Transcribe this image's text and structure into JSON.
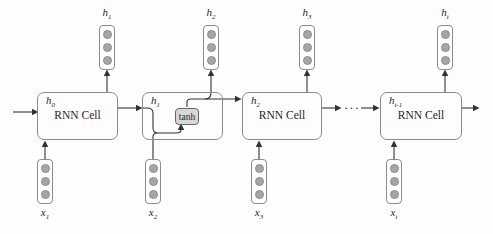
{
  "figure": {
    "type": "diagram",
    "ellipsis": "···",
    "colors": {
      "background": "#fdfdfd",
      "box_stroke": "#8c8c8c",
      "wire": "#333333",
      "neuron_fill": "#a6a6a6",
      "tanh_fill": "#d8d8d8",
      "tanh_stroke": "#666666",
      "text": "#1f1f1f"
    },
    "cells": [
      {
        "state_base": "h",
        "state_sub": "0",
        "body": "RNN Cell"
      },
      {
        "state_base": "h",
        "state_sub": "1",
        "body": "",
        "activation": "tanh"
      },
      {
        "state_base": "h",
        "state_sub": "2",
        "body": "RNN Cell"
      },
      {
        "state_base": "h",
        "state_sub": "t-1",
        "body": "RNN Cell"
      }
    ],
    "outputs": [
      {
        "base": "h",
        "sub": "1"
      },
      {
        "base": "h",
        "sub": "2"
      },
      {
        "base": "h",
        "sub": "3"
      },
      {
        "base": "h",
        "sub": "t"
      }
    ],
    "inputs": [
      {
        "base": "x",
        "sub": "1"
      },
      {
        "base": "x",
        "sub": "2"
      },
      {
        "base": "x",
        "sub": "3"
      },
      {
        "base": "x",
        "sub": "t"
      }
    ]
  }
}
